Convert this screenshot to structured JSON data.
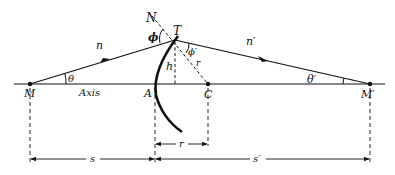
{
  "diagram": {
    "type": "refraction at spherical surface",
    "labels": {
      "N": "N",
      "T": "T",
      "phi": "ϕ",
      "phi_prime": "ϕ′",
      "r_radius": "r",
      "h": "h",
      "n": "n",
      "n_prime": "n′",
      "theta": "θ",
      "theta_prime": "θ′",
      "M": "M",
      "axis": "Axis",
      "A": "A",
      "C": "C",
      "M_prime": "M′",
      "s": "s",
      "r_dim": "r",
      "s_prime": "s′"
    },
    "colors": {
      "ink": "#111111",
      "background": "#ffffff"
    }
  }
}
